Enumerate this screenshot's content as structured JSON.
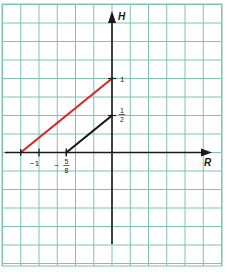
{
  "chart_data": {
    "type": "line",
    "title": "",
    "xlabel": "R",
    "ylabel": "H",
    "xlim": [
      -1.5,
      1.5
    ],
    "ylim": [
      -1.25,
      2.0
    ],
    "grid": true,
    "grid_step_x": 0.25,
    "grid_step_y": 0.25,
    "x_ticks": [
      {
        "value": -1,
        "label": "−1"
      },
      {
        "value": -0.625,
        "label_sign": "−",
        "label_num": "5",
        "label_den": "8"
      }
    ],
    "y_ticks": [
      {
        "value": 1,
        "label": "1"
      },
      {
        "value": 0.5,
        "label_num": "1",
        "label_den": "2"
      }
    ],
    "series": [
      {
        "name": "red-line",
        "color": "#d42a2a",
        "points": [
          [
            -1.25,
            0
          ],
          [
            0,
            1
          ]
        ]
      },
      {
        "name": "black-line",
        "color": "#1a1a1a",
        "points": [
          [
            -0.625,
            0
          ],
          [
            0,
            0.5
          ]
        ]
      }
    ],
    "colors": {
      "grid": "#7cc4b0",
      "axis": "#1a1a1a",
      "background": "#ffffff"
    }
  }
}
